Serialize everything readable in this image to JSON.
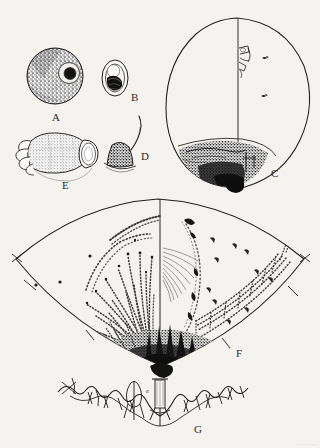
{
  "plate": {
    "title": "Scientific illustration plate",
    "background_color": "#f5f3ef",
    "ink_color": "#1d1d1d",
    "corner_mark": "———",
    "figures": [
      {
        "key": "A",
        "label": "A",
        "name": "figure-a-stippled-sphere",
        "description": "Densely stippled spherical body with off-centre dark circular aperture ringed by a pale halo",
        "label_x": 52,
        "label_y": 112,
        "center_x": 55,
        "center_y": 76,
        "radius": 28
      },
      {
        "key": "B",
        "label": "B",
        "name": "figure-b-ovoid-capsule",
        "description": "Small ovoid capsule with inner outline and dark shaded lower mass",
        "label_x": 131,
        "label_y": 92,
        "center_x": 115,
        "center_y": 78
      },
      {
        "key": "C",
        "label": "C",
        "name": "figure-c-egg-outline",
        "description": "Large pear-shaped egg outline with vertical median line, paired dorsal appendages and dark stippled basal patch",
        "label_x": 271,
        "label_y": 168,
        "center_x": 238,
        "center_y": 100
      },
      {
        "key": "D",
        "label": "D",
        "name": "figure-d-cone-with-bristle",
        "description": "Small shaded dome or cone bearing a single long curved bristle",
        "label_x": 141,
        "label_y": 153,
        "center_x": 122,
        "center_y": 157
      },
      {
        "key": "E",
        "label": "E",
        "name": "figure-e-lobed-organ",
        "description": "Lobed finger-like organ opening into a flared funnel at the right",
        "label_x": 62,
        "label_y": 180,
        "center_x": 57,
        "center_y": 157
      },
      {
        "key": "F",
        "label": "F",
        "name": "figure-f-lens-shaped-field",
        "description": "Large lens or diamond shaped field divided by a median line; left half with long rows of setae, right half with scattered specks and a marginal band",
        "label_x": 236,
        "label_y": 350,
        "center_x": 160,
        "center_y": 285
      },
      {
        "key": "G",
        "label": "G",
        "name": "figure-g-wavy-margin",
        "description": "Wavy horizontal margin profile bearing branched spines and a central tubular structure",
        "label_x": 194,
        "label_y": 427,
        "center_x": 160,
        "center_y": 405
      }
    ],
    "inline_labels": [
      {
        "text": "e",
        "name": "inline-label-e",
        "x": 146,
        "y": 391
      }
    ]
  }
}
